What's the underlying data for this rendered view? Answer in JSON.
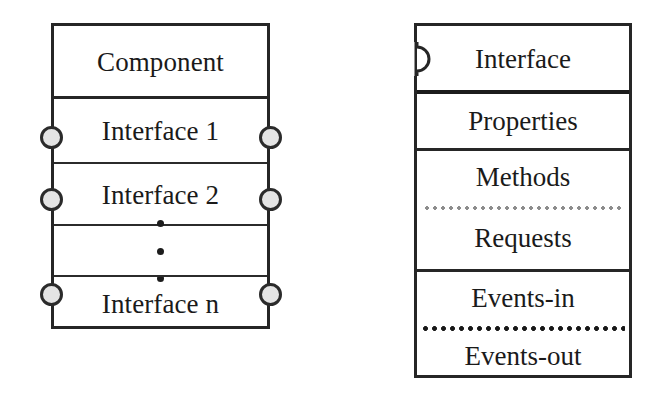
{
  "diagram": {
    "colors": {
      "stroke": "#262626",
      "text": "#1a1a1a",
      "ball_fill": "#e4e4e4",
      "dotted_light": "#8d8d8d",
      "dotted_dark": "#181818",
      "background": "#ffffff"
    },
    "component_box": {
      "name": "component-box",
      "header": "Component",
      "rows": [
        {
          "label": "Interface 1",
          "has_ports": true
        },
        {
          "label": "Interface 2",
          "has_ports": true
        },
        {
          "label": "",
          "has_ports": false,
          "ellipsis": true
        },
        {
          "label": "Interface n",
          "has_ports": true
        }
      ],
      "ellipsis_glyph": "vertical-ellipsis",
      "port_count": 8
    },
    "interface_box": {
      "name": "interface-box",
      "header": "Interface",
      "socket_icon": "socket-notch-icon",
      "rows": [
        {
          "label": "Properties",
          "separator_above": "solid-heavy"
        },
        {
          "label": "Methods",
          "separator_above": "solid"
        },
        {
          "label": "Requests",
          "separator_above": "dotted-light"
        },
        {
          "label": "Events-in",
          "separator_above": "solid"
        },
        {
          "label": "Events-out",
          "separator_above": "dotted-dark"
        }
      ]
    }
  }
}
